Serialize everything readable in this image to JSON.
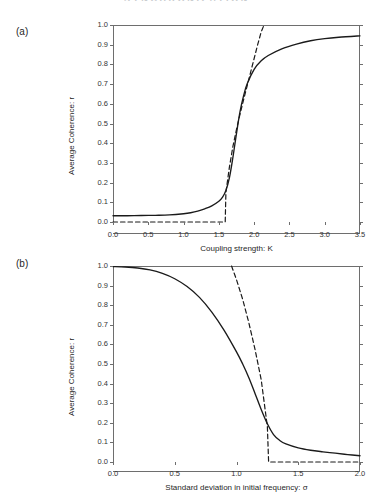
{
  "header": {
    "running_head": "SYNCHRONIZATION"
  },
  "panels": [
    {
      "label": "(a)",
      "name": "panel-a"
    },
    {
      "label": "(b)",
      "name": "panel-b"
    }
  ],
  "chart_data": [
    {
      "type": "line",
      "panel": "(a)",
      "title": "",
      "xlabel": "Coupling strength: K",
      "ylabel": "Average Coherence: r",
      "xlim": [
        0.0,
        3.5
      ],
      "ylim": [
        0.0,
        1.0
      ],
      "xticks": [
        "0.0",
        "0.5",
        "1.0",
        "1.5",
        "2.0",
        "2.5",
        "3.0",
        "3.5"
      ],
      "xtick_values": [
        0.0,
        0.5,
        1.0,
        1.5,
        2.0,
        2.5,
        3.0,
        3.5
      ],
      "yticks": [
        "0.0",
        "0.1",
        "0.2",
        "0.3",
        "0.4",
        "0.5",
        "0.6",
        "0.7",
        "0.8",
        "0.9",
        "1.0"
      ],
      "ytick_values": [
        0.0,
        0.1,
        0.2,
        0.3,
        0.4,
        0.5,
        0.6,
        0.7,
        0.8,
        0.9,
        1.0
      ],
      "grid": false,
      "legend": "none",
      "series": [
        {
          "name": "simulated average coherence",
          "style": "solid",
          "color": "#1a1a1a",
          "x": [
            0.0,
            0.2,
            0.4,
            0.6,
            0.8,
            1.0,
            1.1,
            1.2,
            1.3,
            1.4,
            1.5,
            1.55,
            1.6,
            1.65,
            1.7,
            1.75,
            1.8,
            1.85,
            1.9,
            2.0,
            2.1,
            2.2,
            2.4,
            2.6,
            2.8,
            3.0,
            3.2,
            3.5
          ],
          "y": [
            0.032,
            0.032,
            0.033,
            0.034,
            0.036,
            0.042,
            0.047,
            0.055,
            0.067,
            0.082,
            0.105,
            0.125,
            0.16,
            0.225,
            0.33,
            0.45,
            0.56,
            0.64,
            0.7,
            0.775,
            0.818,
            0.845,
            0.88,
            0.903,
            0.92,
            0.931,
            0.938,
            0.945
          ]
        },
        {
          "name": "theoretical branch",
          "style": "dashed",
          "color": "#1a1a1a",
          "x": [
            0.0,
            1.59,
            1.6,
            1.65,
            1.7,
            1.75,
            1.8,
            1.85,
            1.9,
            1.95,
            2.0,
            2.05,
            2.1,
            2.14
          ],
          "y": [
            0.0,
            0.0,
            0.15,
            0.28,
            0.385,
            0.47,
            0.548,
            0.62,
            0.69,
            0.76,
            0.83,
            0.9,
            0.965,
            1.0
          ]
        }
      ],
      "annotations": {
        "critical_coupling": 1.6,
        "baseline_coherence": 0.032,
        "saturation_coherence": 0.945
      }
    },
    {
      "type": "line",
      "panel": "(b)",
      "title": "",
      "xlabel": "Standard deviation in initial frequency: σ",
      "ylabel": "Average Coherence: r",
      "xlim": [
        0.0,
        2.0
      ],
      "ylim": [
        0.0,
        1.0
      ],
      "xticks": [
        "0.0",
        "0.5",
        "1.0",
        "1.5",
        "2.0"
      ],
      "xtick_values": [
        0.0,
        0.5,
        1.0,
        1.5,
        2.0
      ],
      "yticks": [
        "0.0",
        "0.1",
        "0.2",
        "0.3",
        "0.4",
        "0.5",
        "0.6",
        "0.7",
        "0.8",
        "0.9",
        "1.0"
      ],
      "ytick_values": [
        0.0,
        0.1,
        0.2,
        0.3,
        0.4,
        0.5,
        0.6,
        0.7,
        0.8,
        0.9,
        1.0
      ],
      "grid": false,
      "legend": "none",
      "series": [
        {
          "name": "simulated average coherence",
          "style": "solid",
          "color": "#1a1a1a",
          "x": [
            0.0,
            0.1,
            0.2,
            0.3,
            0.4,
            0.5,
            0.6,
            0.7,
            0.8,
            0.9,
            1.0,
            1.05,
            1.1,
            1.15,
            1.2,
            1.25,
            1.3,
            1.35,
            1.4,
            1.5,
            1.6,
            1.7,
            1.8,
            1.9,
            2.0
          ],
          "y": [
            0.997,
            0.995,
            0.99,
            0.98,
            0.962,
            0.935,
            0.895,
            0.84,
            0.765,
            0.672,
            0.562,
            0.5,
            0.43,
            0.35,
            0.268,
            0.195,
            0.14,
            0.11,
            0.092,
            0.072,
            0.06,
            0.052,
            0.045,
            0.038,
            0.032
          ]
        },
        {
          "name": "theoretical branch",
          "style": "dashed",
          "color": "#1a1a1a",
          "x": [
            0.96,
            1.0,
            1.05,
            1.1,
            1.15,
            1.2,
            1.25,
            1.26,
            1.26,
            1.4,
            1.6,
            1.8,
            2.0
          ],
          "y": [
            1.0,
            0.93,
            0.83,
            0.71,
            0.575,
            0.42,
            0.18,
            0.0,
            0.0,
            0.0,
            0.0,
            0.0,
            0.0
          ]
        }
      ],
      "annotations": {
        "critical_sigma": 1.26,
        "initial_coherence": 0.997,
        "tail_coherence": 0.032
      }
    }
  ]
}
